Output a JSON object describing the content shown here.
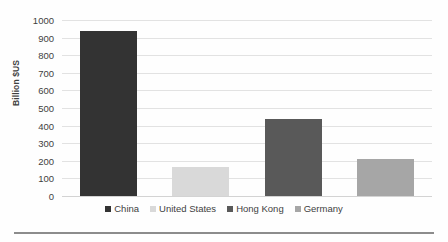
{
  "chart_data": {
    "type": "bar",
    "title": "",
    "subtitle": "",
    "xlabel": "",
    "ylabel": "Billion $US",
    "ylim": [
      0,
      1000
    ],
    "ytick_step": 100,
    "grid": "horizontal",
    "legend_position": "bottom-center",
    "categories": [
      "China",
      "United States",
      "Hong Kong",
      "Germany"
    ],
    "values": [
      940,
      165,
      435,
      212
    ],
    "tick_labels": [
      "0",
      "100",
      "200",
      "300",
      "400",
      "500",
      "600",
      "700",
      "800",
      "900",
      "1000"
    ],
    "series": [
      {
        "name": "China",
        "value": 940,
        "color": "#333333"
      },
      {
        "name": "United States",
        "value": 165,
        "color": "#d9d9d9"
      },
      {
        "name": "Hong Kong",
        "value": 435,
        "color": "#595959"
      },
      {
        "name": "Germany",
        "value": 212,
        "color": "#a6a6a6"
      }
    ],
    "legend": [
      {
        "label": "China",
        "color": "#333333"
      },
      {
        "label": "United States",
        "color": "#d9d9d9"
      },
      {
        "label": "Hong Kong",
        "color": "#595959"
      },
      {
        "label": "Germany",
        "color": "#a6a6a6"
      }
    ],
    "colors": {
      "gridline": "#e2e2e2",
      "axis": "#d3d3d3",
      "text": "#3f3f3f",
      "footer_rule": "#8c8c8c"
    }
  }
}
